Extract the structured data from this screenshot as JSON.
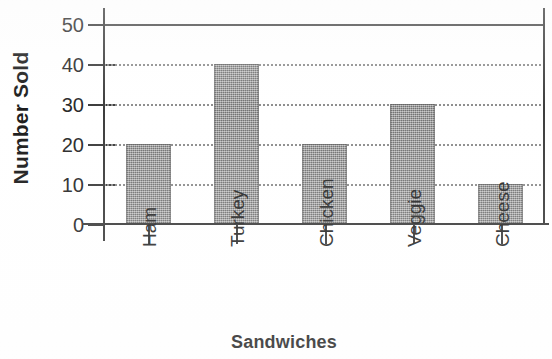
{
  "chart_data": {
    "type": "bar",
    "title": "",
    "xlabel": "Sandwiches",
    "ylabel": "Number Sold",
    "categories": [
      "Ham",
      "Turkey",
      "Chicken",
      "Veggie",
      "Cheese"
    ],
    "values": [
      20,
      40,
      20,
      30,
      10
    ],
    "series": [
      {
        "name": "Number Sold",
        "values": [
          20,
          40,
          20,
          30,
          10
        ]
      }
    ],
    "ylim": [
      0,
      50
    ],
    "y_ticks": [
      0,
      10,
      20,
      30,
      40,
      50
    ],
    "y_tick_labels": [
      "0",
      "10",
      "20",
      "30",
      "40",
      "50"
    ],
    "grid": "horizontal-dotted",
    "legend": "none",
    "bar_color": "#8a8a8a",
    "axis_color": "#3d3d3d",
    "gridline_color": "#8e8e8e",
    "text_color": "#2a2a2a",
    "x_tick_label_rotation": "90",
    "bars": [
      {
        "category": "Ham",
        "value": 20
      },
      {
        "category": "Turkey",
        "value": 40
      },
      {
        "category": "Chicken",
        "value": 20
      },
      {
        "category": "Veggie",
        "value": 30
      },
      {
        "category": "Cheese",
        "value": 10
      }
    ]
  }
}
